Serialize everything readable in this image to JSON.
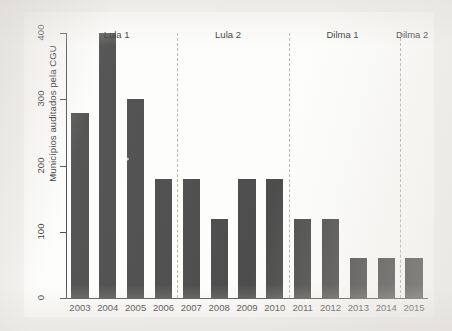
{
  "chart_data": {
    "type": "bar",
    "title": "",
    "subtitle": "",
    "xlabel": "",
    "ylabel": "Municípios auditados pela CGU",
    "categories": [
      "2003",
      "2004",
      "2005",
      "2006",
      "2007",
      "2008",
      "2009",
      "2010",
      "2011",
      "2012",
      "2013",
      "2014",
      "2015"
    ],
    "values": [
      280,
      400,
      300,
      180,
      180,
      120,
      180,
      180,
      120,
      120,
      60,
      60,
      60
    ],
    "ylim": [
      0,
      400
    ],
    "yticks": [
      "0",
      "100",
      "200",
      "300",
      "400"
    ],
    "ytick_values": [
      0,
      100,
      200,
      300,
      400
    ],
    "grid": false,
    "legend": "none",
    "bar_color": "#4d4d4d",
    "axis_color": "#4a4a4a",
    "divider_color": "#b9b6b0",
    "annotations": [
      {
        "label": "Lula 1",
        "start_category": "2003",
        "end_category": "2006"
      },
      {
        "label": "Lula 2",
        "start_category": "2007",
        "end_category": "2010"
      },
      {
        "label": "Dilma 1",
        "start_category": "2011",
        "end_category": "2014"
      },
      {
        "label": "Dilma 2",
        "start_category": "2015",
        "end_category": "2015"
      }
    ],
    "divider_after_categories": [
      "2006",
      "2010",
      "2014"
    ]
  }
}
